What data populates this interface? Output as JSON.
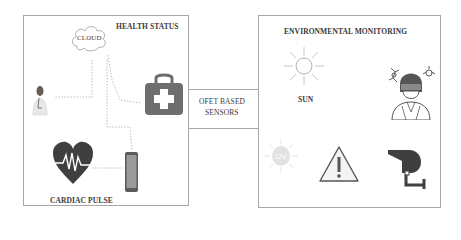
{
  "health_panel": {
    "title": "HEALTH STATUS",
    "cloud_label": "CLOUD",
    "cardiac_label": "CARDIAC PULSE",
    "icons": [
      "doctor-icon",
      "cloud-icon",
      "medical-kit-icon",
      "heart-pulse-icon",
      "smartphone-icon"
    ]
  },
  "center_node": {
    "line1": "OFET BASED",
    "line2": "SENSORS"
  },
  "environment_panel": {
    "title": "ENVIRONMENTAL MONITORING",
    "sun_label": "SUN",
    "icons": [
      "sun-icon",
      "masked-person-icon",
      "uv-icon",
      "warning-icon",
      "cctv-camera-icon"
    ]
  },
  "colors": {
    "border": "#a8a8a8",
    "icon_dark": "#4a4a4a",
    "icon_mid": "#7a7a7a",
    "connector": "#c0c0c0"
  }
}
